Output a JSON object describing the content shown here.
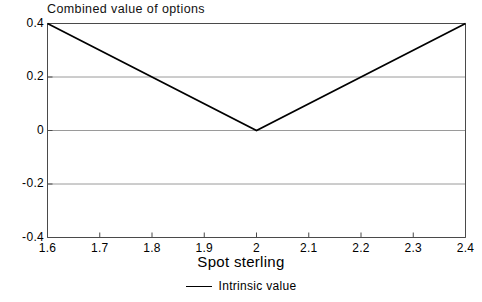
{
  "chart_data": {
    "type": "line",
    "title": "Combined value of options",
    "xlabel": "Spot sterling",
    "ylabel": "",
    "xlim": [
      1.6,
      2.4
    ],
    "ylim": [
      -0.4,
      0.4
    ],
    "grid": true,
    "legend_position": "bottom-center",
    "x_ticks": [
      "1.6",
      "1.7",
      "1.8",
      "1.9",
      "2",
      "2.1",
      "2.2",
      "2.3",
      "2.4"
    ],
    "x_tick_values": [
      1.6,
      1.7,
      1.8,
      1.9,
      2,
      2.1,
      2.2,
      2.3,
      2.4
    ],
    "y_ticks": [
      "0.4",
      "0.2",
      "0",
      "-0.2",
      "-0.4"
    ],
    "y_tick_values": [
      0.4,
      0.2,
      0,
      -0.2,
      -0.4
    ],
    "gridline_values": [
      0.2,
      0,
      -0.2
    ],
    "series": [
      {
        "name": "Intrinsic value",
        "color": "#000000",
        "x": [
          1.6,
          2.0,
          2.4
        ],
        "values": [
          0.4,
          0.0,
          0.4
        ]
      }
    ],
    "legend": [
      "Intrinsic value"
    ]
  },
  "colors": {
    "line": "#000000",
    "grid": "#9a9a9a",
    "axis": "#4a4a4a",
    "background": "#ffffff",
    "text": "#000000"
  }
}
